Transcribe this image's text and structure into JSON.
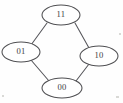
{
  "figure": {
    "kind": "hasse-lattice-diagram",
    "background_color": "#fefefe",
    "node_outline_color": "#4f4f52",
    "edge_color": "#55555a",
    "label_color": "#3b3b3e",
    "node_fill_color": "#ffffff"
  },
  "nodes": [
    {
      "id": "top",
      "label": "11",
      "cx": 61,
      "cy": 15,
      "rx": 19,
      "ry": 10
    },
    {
      "id": "left",
      "label": "01",
      "cx": 21,
      "cy": 52,
      "rx": 19,
      "ry": 10
    },
    {
      "id": "right",
      "label": "10",
      "cx": 99,
      "cy": 56,
      "rx": 19,
      "ry": 10
    },
    {
      "id": "bottom",
      "label": "00",
      "cx": 62,
      "cy": 88,
      "rx": 20,
      "ry": 10
    }
  ],
  "edges": [
    {
      "id": "edge-top-left",
      "from": "top",
      "to": "left",
      "x1": 47,
      "y1": 23,
      "x2": 31,
      "y2": 45
    },
    {
      "id": "edge-top-right",
      "from": "top",
      "to": "right",
      "x1": 75,
      "y1": 23,
      "x2": 89,
      "y2": 48
    },
    {
      "id": "edge-left-bottom",
      "from": "left",
      "to": "bottom",
      "x1": 31,
      "y1": 60,
      "x2": 49,
      "y2": 81
    },
    {
      "id": "edge-right-bottom",
      "from": "right",
      "to": "bottom",
      "x1": 89,
      "y1": 64,
      "x2": 76,
      "y2": 81
    }
  ]
}
